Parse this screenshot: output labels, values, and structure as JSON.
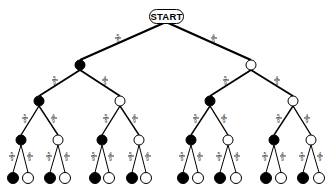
{
  "root": {
    "label": "START",
    "x": 166,
    "y": 16
  },
  "colors": {
    "black_ball": "#000000",
    "white_ball": "#ffffff",
    "line": "#000000"
  },
  "probabilities": {
    "black": {
      "num": "5",
      "den": "9"
    },
    "white": {
      "num": "4",
      "den": "9"
    }
  },
  "levels": [
    {
      "y": 65,
      "nodes": [
        {
          "x": 80,
          "color": "black",
          "parent": "root"
        },
        {
          "x": 251,
          "color": "white",
          "parent": "root"
        }
      ]
    },
    {
      "y": 101,
      "nodes": [
        {
          "x": 39,
          "color": "black",
          "parent": 0
        },
        {
          "x": 120,
          "color": "white",
          "parent": 0
        },
        {
          "x": 210,
          "color": "black",
          "parent": 1
        },
        {
          "x": 293,
          "color": "white",
          "parent": 1
        }
      ]
    },
    {
      "y": 140,
      "nodes": [
        {
          "x": 21,
          "color": "black",
          "parent": 0
        },
        {
          "x": 58,
          "color": "white",
          "parent": 0
        },
        {
          "x": 102,
          "color": "black",
          "parent": 1
        },
        {
          "x": 139,
          "color": "white",
          "parent": 1
        },
        {
          "x": 191,
          "color": "black",
          "parent": 2
        },
        {
          "x": 228,
          "color": "white",
          "parent": 2
        },
        {
          "x": 274,
          "color": "black",
          "parent": 3
        },
        {
          "x": 311,
          "color": "white",
          "parent": 3
        }
      ]
    },
    {
      "y": 178,
      "nodes": [
        {
          "x": 13,
          "color": "black",
          "parent": 0
        },
        {
          "x": 28,
          "color": "white",
          "parent": 0
        },
        {
          "x": 50,
          "color": "black",
          "parent": 1
        },
        {
          "x": 65,
          "color": "white",
          "parent": 1
        },
        {
          "x": 95,
          "color": "black",
          "parent": 2
        },
        {
          "x": 109,
          "color": "white",
          "parent": 2
        },
        {
          "x": 132,
          "color": "black",
          "parent": 3
        },
        {
          "x": 146,
          "color": "white",
          "parent": 3
        },
        {
          "x": 183,
          "color": "black",
          "parent": 4
        },
        {
          "x": 198,
          "color": "white",
          "parent": 4
        },
        {
          "x": 220,
          "color": "black",
          "parent": 5
        },
        {
          "x": 236,
          "color": "white",
          "parent": 5
        },
        {
          "x": 266,
          "color": "black",
          "parent": 6
        },
        {
          "x": 281,
          "color": "white",
          "parent": 6
        },
        {
          "x": 303,
          "color": "black",
          "parent": 7
        },
        {
          "x": 319,
          "color": "white",
          "parent": 7
        }
      ]
    }
  ],
  "node_radius": [
    5,
    5,
    5,
    5.5
  ],
  "line_widths": [
    2.2,
    1.8,
    1.4,
    1.0
  ]
}
